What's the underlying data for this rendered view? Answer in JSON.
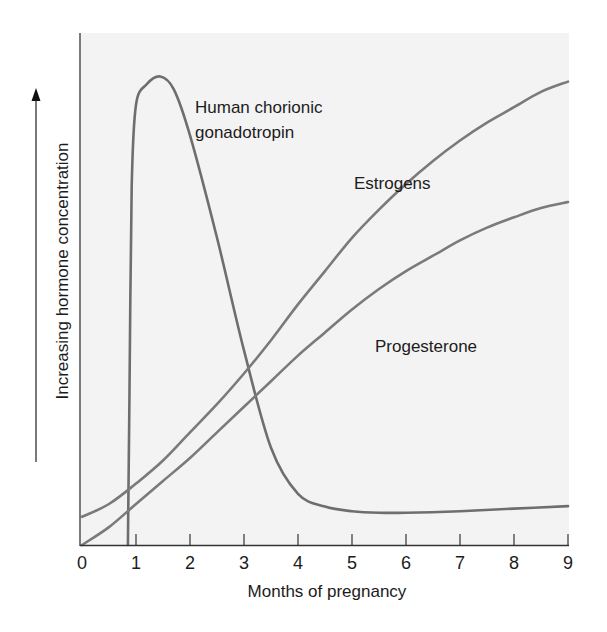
{
  "chart_data": {
    "type": "line",
    "title": "",
    "xlabel": "Months of pregnancy",
    "ylabel": "Increasing hormone concentration",
    "x_ticks": [
      "0",
      "1",
      "2",
      "3",
      "4",
      "5",
      "6",
      "7",
      "8",
      "9"
    ],
    "xlim": [
      0,
      9
    ],
    "ylim": [
      0,
      100
    ],
    "grid": false,
    "legend": "inline labels",
    "series": [
      {
        "name": "Human chorionic gonadotropin",
        "label_lines": [
          "Human chorionic",
          "gonadotropin"
        ],
        "color": "#6e6e6e",
        "points": [
          [
            0.85,
            0
          ],
          [
            0.88,
            30
          ],
          [
            0.92,
            70
          ],
          [
            1.0,
            86
          ],
          [
            1.2,
            90
          ],
          [
            1.45,
            91.5
          ],
          [
            1.7,
            89
          ],
          [
            2.0,
            80
          ],
          [
            2.5,
            60
          ],
          [
            3.0,
            38
          ],
          [
            3.5,
            19
          ],
          [
            4.0,
            10
          ],
          [
            4.5,
            7.5
          ],
          [
            5.0,
            6.6
          ],
          [
            5.5,
            6.3
          ],
          [
            6.0,
            6.3
          ],
          [
            7.0,
            6.6
          ],
          [
            8.0,
            7.1
          ],
          [
            9.0,
            7.6
          ]
        ]
      },
      {
        "name": "Estrogens",
        "label_lines": [
          "Estrogens"
        ],
        "color": "#7a7a7a",
        "points": [
          [
            0,
            5.5
          ],
          [
            0.5,
            8
          ],
          [
            1,
            12
          ],
          [
            1.5,
            16.5
          ],
          [
            2,
            22
          ],
          [
            2.5,
            27.5
          ],
          [
            3,
            33.5
          ],
          [
            3.5,
            40
          ],
          [
            4,
            47
          ],
          [
            4.5,
            53.5
          ],
          [
            5,
            60
          ],
          [
            5.5,
            65.5
          ],
          [
            6,
            70.5
          ],
          [
            6.5,
            75
          ],
          [
            7,
            79
          ],
          [
            7.5,
            82.5
          ],
          [
            8,
            85.5
          ],
          [
            8.5,
            88.5
          ],
          [
            9,
            90.5
          ]
        ]
      },
      {
        "name": "Progesterone",
        "label_lines": [
          "Progesterone"
        ],
        "color": "#7a7a7a",
        "points": [
          [
            0,
            0
          ],
          [
            0.5,
            3.5
          ],
          [
            1,
            8
          ],
          [
            1.5,
            12.5
          ],
          [
            2,
            17
          ],
          [
            2.5,
            22
          ],
          [
            3,
            27
          ],
          [
            3.5,
            32
          ],
          [
            4,
            37
          ],
          [
            4.5,
            41.5
          ],
          [
            5,
            46
          ],
          [
            5.5,
            50
          ],
          [
            6,
            53.5
          ],
          [
            6.5,
            56.5
          ],
          [
            7,
            59.5
          ],
          [
            7.5,
            62
          ],
          [
            8,
            64
          ],
          [
            8.5,
            65.8
          ],
          [
            9,
            67
          ]
        ]
      }
    ]
  },
  "labels": {
    "hcg_line1": "Human chorionic",
    "hcg_line2": "gonadotropin",
    "estrogens": "Estrogens",
    "progesterone": "Progesterone",
    "x_axis_title": "Months of pregnancy",
    "y_axis_title": "Increasing hormone concentration"
  },
  "colors": {
    "plot_background": "#f3f3f3",
    "axis": "#333333",
    "curve": "#707070",
    "text": "#1c1c1c"
  }
}
